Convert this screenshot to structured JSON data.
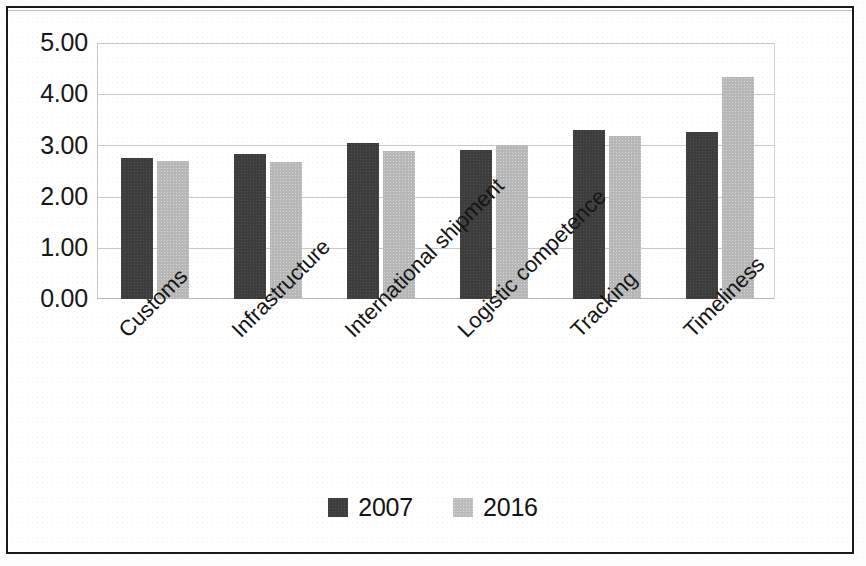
{
  "chart_data": {
    "type": "bar",
    "title": "",
    "subtitle": "",
    "xlabel": "",
    "ylabel": "",
    "categories": [
      "Customs",
      "Infrastructure",
      "International shipment",
      "Logistic competence",
      "Tracking",
      "Timeliness"
    ],
    "series": [
      {
        "name": "2007",
        "color": "#3d3d3d",
        "values": [
          2.75,
          2.84,
          3.05,
          2.91,
          3.3,
          3.26
        ]
      },
      {
        "name": "2016",
        "color": "#b7b7b7",
        "values": [
          2.7,
          2.67,
          2.9,
          3.0,
          3.18,
          4.33
        ]
      }
    ],
    "ylim": [
      0,
      5
    ],
    "ytick_step": 1,
    "ytick_labels": [
      "0.00",
      "1.00",
      "2.00",
      "3.00",
      "4.00",
      "5.00"
    ],
    "grid": true,
    "grid_axis": "y",
    "legend_position": "bottom",
    "xtick_rotation": -45
  },
  "legend": {
    "items": [
      {
        "label": "2007",
        "swatch": "legend-swatch-2007"
      },
      {
        "label": "2016",
        "swatch": "legend-swatch-2016"
      }
    ]
  }
}
